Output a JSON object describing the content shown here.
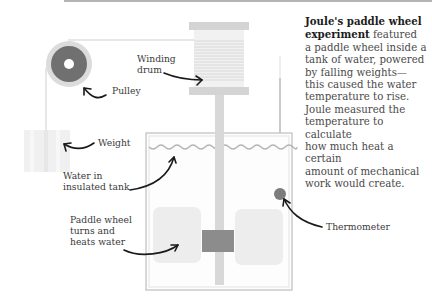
{
  "description": {
    "title": "Joule's paddle wheel experiment",
    "title_line1": "Joule's paddle wheel",
    "title_line2": "experiment",
    "body_line2_rest": " featured",
    "body_lines": [
      "a paddle wheel inside a",
      "tank of water, powered",
      "by falling weights—",
      "this caused the water",
      "temperature to rise.",
      "Joule measured the",
      "temperature to calculate",
      "how much heat a certain",
      "amount of mechanical",
      "work would create."
    ]
  },
  "labels": {
    "pulley": "Pulley",
    "winding_drum": "Winding\ndrum",
    "weight": "Weight",
    "water_tank": "Water in\ninsulated tank",
    "paddle_wheel": "Paddle wheel\nturns and\nheats water",
    "thermometer": "Thermometer"
  },
  "colors": {
    "pulley_dark": "#6e6e6e",
    "pulley_ring": "#d8d8d8",
    "drum": "#e4e4e4",
    "drum_flange": "#d2d2d2",
    "tank_outline": "#bdbdbd",
    "water_line": "#b0b0b0",
    "paddle": "#ececec",
    "hub": "#8a8a8a",
    "shaft": "#d0d0d0",
    "thermometer_bulb": "#7c7c7c",
    "arrow": "#1a1a1a"
  }
}
